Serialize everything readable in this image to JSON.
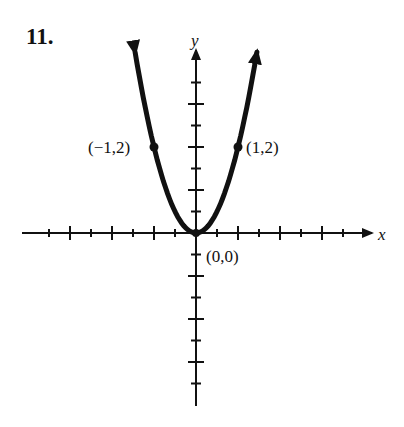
{
  "problem_number": "11.",
  "chart_data": {
    "type": "line",
    "title": "",
    "function": "y = 2x^2",
    "xlabel": "x",
    "ylabel": "y",
    "xlim": [
      -4,
      4
    ],
    "ylim": [
      -4,
      4
    ],
    "tick_step": 0.5,
    "major_tick_step": 1,
    "grid": false,
    "legend": null,
    "series": [
      {
        "name": "parabola",
        "x": [
          -1.45,
          -1.25,
          -1,
          -0.75,
          -0.5,
          -0.25,
          0,
          0.25,
          0.5,
          0.75,
          1,
          1.25,
          1.45
        ],
        "y": [
          4.2,
          3.125,
          2,
          1.125,
          0.5,
          0.125,
          0,
          0.125,
          0.5,
          1.125,
          2,
          3.125,
          4.2
        ],
        "arrows_at_ends": true
      }
    ],
    "points": [
      {
        "x": -1,
        "y": 2,
        "label": "(−1,2)"
      },
      {
        "x": 1,
        "y": 2,
        "label": "(1,2)"
      },
      {
        "x": 0,
        "y": 0,
        "label": "(0,0)"
      }
    ],
    "colors": {
      "curve": "#111111",
      "axes": "#111111",
      "background": "#ffffff"
    }
  }
}
